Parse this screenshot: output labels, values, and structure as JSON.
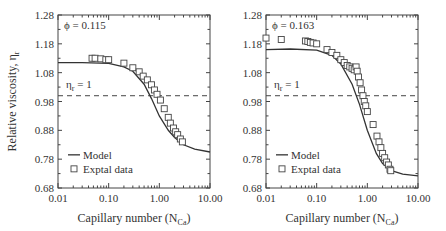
{
  "chart_data": [
    {
      "type": "line",
      "title": "",
      "annotation": "ϕ = 0.115",
      "ref_label": "ηr = 1",
      "xlabel": "Capillary number (N_Ca)",
      "ylabel": "Relative viscosity, ηr",
      "xscale": "log",
      "xlim": [
        0.01,
        10.0
      ],
      "ylim": [
        0.68,
        1.28
      ],
      "xticks": [
        "0.01",
        "0.10",
        "1.00",
        "10.00"
      ],
      "yticks": [
        "0.68",
        "0.78",
        "0.88",
        "0.98",
        "1.08",
        "1.18",
        "1.28"
      ],
      "legend": [
        "Model",
        "Exptal data"
      ],
      "legend_position": "lower left",
      "reference_line": 1.0,
      "series": [
        {
          "name": "Model",
          "style": "line",
          "x": [
            0.01,
            0.03,
            0.1,
            0.2,
            0.3,
            0.5,
            0.7,
            1.0,
            1.5,
            2.0,
            3.0,
            5.0,
            10.0
          ],
          "y": [
            1.115,
            1.115,
            1.112,
            1.1,
            1.085,
            1.04,
            0.99,
            0.93,
            0.88,
            0.855,
            0.83,
            0.815,
            0.805
          ]
        },
        {
          "name": "Exptal data",
          "style": "square-marker",
          "x": [
            0.047,
            0.054,
            0.07,
            0.088,
            0.1,
            0.2,
            0.3,
            0.4,
            0.48,
            0.58,
            0.7,
            0.8,
            0.9,
            1.05,
            1.25,
            1.5,
            1.65,
            1.9,
            2.1,
            2.3,
            2.6,
            2.85
          ],
          "y": [
            1.13,
            1.13,
            1.128,
            1.125,
            1.125,
            1.113,
            1.097,
            1.083,
            1.068,
            1.055,
            1.038,
            1.02,
            1.005,
            0.985,
            0.955,
            0.925,
            0.905,
            0.888,
            0.875,
            0.865,
            0.85,
            0.84
          ]
        }
      ]
    },
    {
      "type": "line",
      "title": "",
      "annotation": "ϕ = 0.163",
      "ref_label": "ηr = 1",
      "xlabel": "Capillary number (N_Ca)",
      "ylabel": "",
      "xscale": "log",
      "xlim": [
        0.01,
        10.0
      ],
      "ylim": [
        0.68,
        1.28
      ],
      "xticks": [
        "0.01",
        "0.10",
        "1.00",
        "10.00"
      ],
      "yticks": [
        "0.68",
        "0.78",
        "0.88",
        "0.98",
        "1.08",
        "1.18",
        "1.28"
      ],
      "legend": [
        "Model",
        "Exptal data"
      ],
      "legend_position": "lower left",
      "reference_line": 1.0,
      "series": [
        {
          "name": "Model",
          "style": "line",
          "x": [
            0.01,
            0.03,
            0.1,
            0.2,
            0.3,
            0.5,
            0.7,
            1.0,
            1.5,
            2.0,
            3.0,
            5.0,
            10.0
          ],
          "y": [
            1.16,
            1.162,
            1.158,
            1.14,
            1.11,
            1.04,
            0.97,
            0.88,
            0.8,
            0.765,
            0.74,
            0.728,
            0.722
          ]
        },
        {
          "name": "Exptal data",
          "style": "square-marker",
          "x": [
            0.01,
            0.02,
            0.06,
            0.067,
            0.075,
            0.085,
            0.1,
            0.16,
            0.2,
            0.25,
            0.3,
            0.35,
            0.4,
            0.45,
            0.5,
            0.55,
            0.6,
            0.63,
            0.67,
            0.72,
            0.77,
            0.82,
            0.87,
            0.93,
            1.0,
            1.3,
            1.55,
            1.7,
            1.85,
            2.0,
            2.2,
            2.4,
            2.6,
            2.8,
            2.9
          ],
          "y": [
            1.2,
            1.195,
            1.19,
            1.188,
            1.185,
            1.183,
            1.18,
            1.16,
            1.15,
            1.14,
            1.125,
            1.115,
            1.105,
            1.1,
            1.095,
            1.09,
            1.1,
            1.085,
            1.065,
            1.045,
            1.02,
            1.0,
            0.98,
            0.965,
            0.945,
            0.9,
            0.86,
            0.84,
            0.82,
            0.8,
            0.785,
            0.77,
            0.76,
            0.745,
            0.74
          ]
        }
      ]
    }
  ]
}
